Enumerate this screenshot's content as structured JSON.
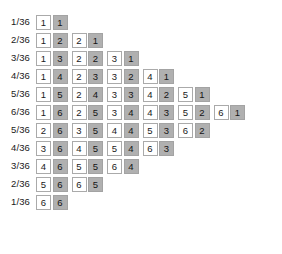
{
  "colors": {
    "die_first_bg": "#ffffff",
    "die_second_bg": "#b0b0b0",
    "die_border": "#aaaaaa",
    "text": "#1a1a1a",
    "background": "#ffffff"
  },
  "legend": {
    "first_die_style": "white",
    "second_die_style": "gray"
  },
  "chart_data": {
    "type": "table",
    "xlabel": "",
    "ylabel": "",
    "grid": false,
    "legend": "none",
    "row_label_header": "Probability",
    "categories": [
      "1/36",
      "2/36",
      "3/36",
      "4/36",
      "5/36",
      "6/36",
      "5/36",
      "4/36",
      "3/36",
      "2/36",
      "1/36"
    ],
    "sums": [
      2,
      3,
      4,
      5,
      6,
      7,
      8,
      9,
      10,
      11,
      12
    ],
    "values": [
      1,
      2,
      3,
      4,
      5,
      6,
      5,
      4,
      3,
      2,
      1
    ],
    "rows": [
      {
        "label": "1/36",
        "sum": 2,
        "count": 1,
        "pairs": [
          [
            1,
            1
          ]
        ]
      },
      {
        "label": "2/36",
        "sum": 3,
        "count": 2,
        "pairs": [
          [
            1,
            2
          ],
          [
            2,
            1
          ]
        ]
      },
      {
        "label": "3/36",
        "sum": 4,
        "count": 3,
        "pairs": [
          [
            1,
            3
          ],
          [
            2,
            2
          ],
          [
            3,
            1
          ]
        ]
      },
      {
        "label": "4/36",
        "sum": 5,
        "count": 4,
        "pairs": [
          [
            1,
            4
          ],
          [
            2,
            3
          ],
          [
            3,
            2
          ],
          [
            4,
            1
          ]
        ]
      },
      {
        "label": "5/36",
        "sum": 6,
        "count": 5,
        "pairs": [
          [
            1,
            5
          ],
          [
            2,
            4
          ],
          [
            3,
            3
          ],
          [
            4,
            2
          ],
          [
            5,
            1
          ]
        ]
      },
      {
        "label": "6/36",
        "sum": 7,
        "count": 6,
        "pairs": [
          [
            1,
            6
          ],
          [
            2,
            5
          ],
          [
            3,
            4
          ],
          [
            4,
            3
          ],
          [
            5,
            2
          ],
          [
            6,
            1
          ]
        ]
      },
      {
        "label": "5/36",
        "sum": 8,
        "count": 5,
        "pairs": [
          [
            2,
            6
          ],
          [
            3,
            5
          ],
          [
            4,
            4
          ],
          [
            5,
            3
          ],
          [
            6,
            2
          ]
        ]
      },
      {
        "label": "4/36",
        "sum": 9,
        "count": 4,
        "pairs": [
          [
            3,
            6
          ],
          [
            4,
            5
          ],
          [
            5,
            4
          ],
          [
            6,
            3
          ]
        ]
      },
      {
        "label": "3/36",
        "sum": 10,
        "count": 3,
        "pairs": [
          [
            4,
            6
          ],
          [
            5,
            5
          ],
          [
            6,
            4
          ]
        ]
      },
      {
        "label": "2/36",
        "sum": 11,
        "count": 2,
        "pairs": [
          [
            5,
            6
          ],
          [
            6,
            5
          ]
        ]
      },
      {
        "label": "1/36",
        "sum": 12,
        "count": 1,
        "pairs": [
          [
            6,
            6
          ]
        ]
      }
    ]
  }
}
